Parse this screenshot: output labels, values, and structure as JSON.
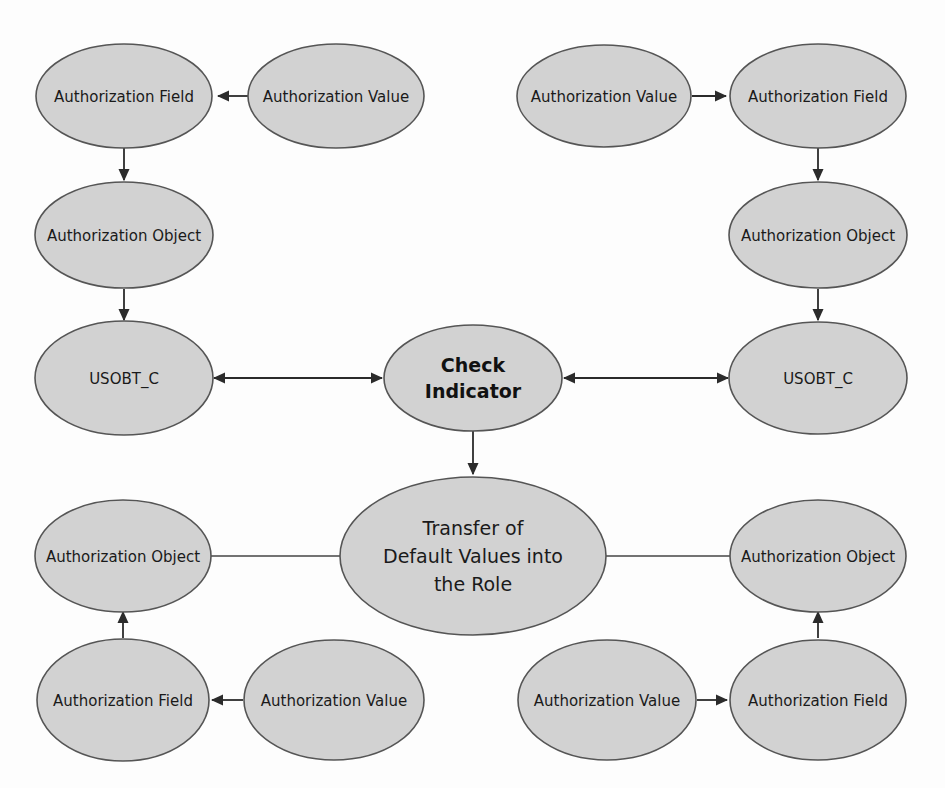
{
  "diagram": {
    "title": "Transfer of Default Values into the Role",
    "background_color": "#fdfdfd",
    "node_fill_color": "#d2d2d2",
    "node_stroke_color": "#555555",
    "edge_color": "#2b2b2b",
    "nodes": {
      "tl_field": {
        "label": "Authorization Field"
      },
      "tl_value": {
        "label": "Authorization Value"
      },
      "tl_object": {
        "label": "Authorization Object"
      },
      "tl_usobt": {
        "label": "USOBT_C"
      },
      "tr_value": {
        "label": "Authorization Value"
      },
      "tr_field": {
        "label": "Authorization Field"
      },
      "tr_object": {
        "label": "Authorization Object"
      },
      "tr_usobt": {
        "label": "USOBT_C"
      },
      "center_check": {
        "label": "Check Indicator",
        "line1": "Check",
        "line2": "Indicator"
      },
      "center_transfer": {
        "label": "Transfer of Default Values into the Role",
        "line1": "Transfer of",
        "line2": "Default Values into",
        "line3": "the Role"
      },
      "bl_object": {
        "label": "Authorization Object"
      },
      "bl_field": {
        "label": "Authorization Field"
      },
      "bl_value": {
        "label": "Authorization Value"
      },
      "br_object": {
        "label": "Authorization Object"
      },
      "br_value": {
        "label": "Authorization Value"
      },
      "br_field": {
        "label": "Authorization Field"
      }
    },
    "edges": [
      {
        "name": "tl-value-to-field",
        "from": "tl_value",
        "to": "tl_field",
        "arrow": "single"
      },
      {
        "name": "tl-field-to-object",
        "from": "tl_field",
        "to": "tl_object",
        "arrow": "single"
      },
      {
        "name": "tl-object-to-usobt",
        "from": "tl_object",
        "to": "tl_usobt",
        "arrow": "single"
      },
      {
        "name": "tl-usobt-to-check",
        "from": "tl_usobt",
        "to": "center_check",
        "arrow": "double"
      },
      {
        "name": "tr-value-to-field",
        "from": "tr_value",
        "to": "tr_field",
        "arrow": "single"
      },
      {
        "name": "tr-field-to-object",
        "from": "tr_field",
        "to": "tr_object",
        "arrow": "single"
      },
      {
        "name": "tr-object-to-usobt",
        "from": "tr_object",
        "to": "tr_usobt",
        "arrow": "single"
      },
      {
        "name": "tr-usobt-to-check",
        "from": "tr_usobt",
        "to": "center_check",
        "arrow": "double"
      },
      {
        "name": "check-to-transfer",
        "from": "center_check",
        "to": "center_transfer",
        "arrow": "single"
      },
      {
        "name": "transfer-to-bl-object",
        "from": "center_transfer",
        "to": "bl_object",
        "arrow": "none"
      },
      {
        "name": "bl-field-to-object",
        "from": "bl_field",
        "to": "bl_object",
        "arrow": "single"
      },
      {
        "name": "bl-value-to-field",
        "from": "bl_value",
        "to": "bl_field",
        "arrow": "single"
      },
      {
        "name": "transfer-to-br-object",
        "from": "center_transfer",
        "to": "br_object",
        "arrow": "none"
      },
      {
        "name": "br-field-to-object",
        "from": "br_field",
        "to": "br_object",
        "arrow": "single"
      },
      {
        "name": "br-value-to-field",
        "from": "br_value",
        "to": "br_field",
        "arrow": "single"
      }
    ]
  }
}
